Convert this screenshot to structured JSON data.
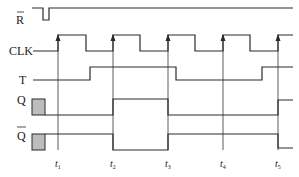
{
  "diagram": {
    "type": "timing-diagram",
    "signals": [
      {
        "id": "R",
        "label": "R",
        "overbar": true
      },
      {
        "id": "CLK",
        "label": "CLK",
        "overbar": false
      },
      {
        "id": "T",
        "label": "T",
        "overbar": false
      },
      {
        "id": "Q",
        "label": "Q",
        "overbar": false
      },
      {
        "id": "Qbar",
        "label": "Q",
        "overbar": true
      }
    ],
    "time_markers": [
      {
        "label": "t",
        "sub": "1"
      },
      {
        "label": "t",
        "sub": "2"
      },
      {
        "label": "t",
        "sub": "3"
      },
      {
        "label": "t",
        "sub": "4"
      },
      {
        "label": "t",
        "sub": "5"
      }
    ],
    "colors": {
      "line": "#2a2a2a",
      "undefined_state_fill": "#bdbdbd",
      "background": "#ffffff"
    }
  }
}
